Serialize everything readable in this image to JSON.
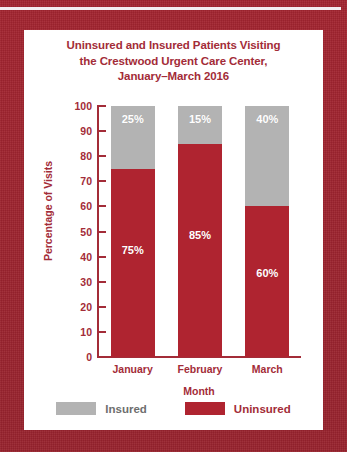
{
  "card": {
    "title_lines": [
      "Uninsured and Insured Patients Visiting",
      "the Crestwood Urgent Care Center,",
      "January–March 2016"
    ]
  },
  "colors": {
    "border_maroon": "#9e2330",
    "uninsured_red": "#af2430",
    "insured_gray": "#b3b3b3",
    "text_dark_red": "#a32c38",
    "legend_insured_text": "#6e6e6e",
    "card_background": "#ffffff",
    "rule_white": "#f3eef0"
  },
  "chart_data": {
    "type": "bar",
    "stacked": true,
    "title": "Uninsured and Insured Patients Visiting the Crestwood Urgent Care Center, January–March 2016",
    "categories": [
      "January",
      "February",
      "March"
    ],
    "series": [
      {
        "name": "Uninsured",
        "values": [
          75,
          85,
          60
        ],
        "color": "#af2430",
        "labels": [
          "75%",
          "85%",
          "60%"
        ]
      },
      {
        "name": "Insured",
        "values": [
          25,
          15,
          40
        ],
        "color": "#b3b3b3",
        "labels": [
          "25%",
          "15%",
          "40%"
        ]
      }
    ],
    "xlabel": "Month",
    "ylabel": "Percentage of Visits",
    "ylim": [
      0,
      100
    ],
    "ytick_values": [
      0,
      10,
      20,
      30,
      40,
      50,
      60,
      70,
      80,
      90,
      100
    ],
    "ytick_labels": [
      "0",
      "10",
      "20",
      "30",
      "40",
      "50",
      "60",
      "70",
      "80",
      "90",
      "100"
    ],
    "grid": false,
    "legend_position": "bottom",
    "legend": [
      {
        "label": "Insured",
        "color": "#b3b3b3"
      },
      {
        "label": "Uninsured",
        "color": "#af2430"
      }
    ]
  }
}
